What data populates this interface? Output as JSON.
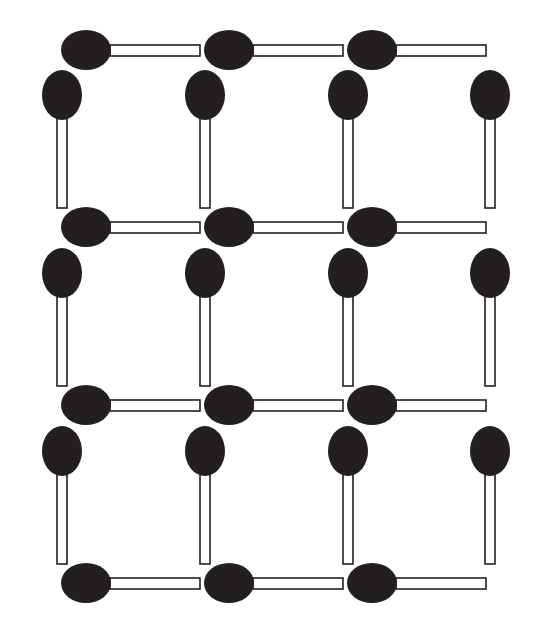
{
  "figure": {
    "width": 542,
    "height": 622,
    "background_color": "#ffffff"
  },
  "style": {
    "head_color": "#231f20",
    "stick_fill": "#ffffff",
    "stick_stroke": "#231f20",
    "stick_stroke_width": 1.6
  },
  "geometry": {
    "column_centers": [
      62,
      205,
      348,
      490
    ],
    "row_centers_horizontal": [
      50,
      227,
      405,
      583
    ],
    "row_tops_vertical": [
      72,
      250,
      428
    ],
    "cell_pitch_x": 143,
    "cell_pitch_y": 178,
    "horizontal_head_rx": 25,
    "horizontal_head_ry": 20,
    "horizontal_stick_length": 90,
    "horizontal_stick_thickness": 11,
    "vertical_head_rx": 20,
    "vertical_head_ry": 25,
    "vertical_stick_length": 90,
    "vertical_stick_thickness": 10
  },
  "counts": {
    "horizontal_matches": 12,
    "vertical_matches": 12,
    "total_matches": 24,
    "unit_squares": 9
  },
  "matches": {
    "horizontal": [
      {
        "id": "h-r0-c0",
        "row": 0,
        "col": 0,
        "head_cx": 86,
        "head_cy": 50,
        "stick_x": 110,
        "stick_y": 45,
        "orientation": "horizontal"
      },
      {
        "id": "h-r0-c1",
        "row": 0,
        "col": 1,
        "head_cx": 229,
        "head_cy": 50,
        "stick_x": 253,
        "stick_y": 45,
        "orientation": "horizontal"
      },
      {
        "id": "h-r0-c2",
        "row": 0,
        "col": 2,
        "head_cx": 372,
        "head_cy": 50,
        "stick_x": 396,
        "stick_y": 45,
        "orientation": "horizontal"
      },
      {
        "id": "h-r1-c0",
        "row": 1,
        "col": 0,
        "head_cx": 86,
        "head_cy": 227,
        "stick_x": 110,
        "stick_y": 222,
        "orientation": "horizontal"
      },
      {
        "id": "h-r1-c1",
        "row": 1,
        "col": 1,
        "head_cx": 229,
        "head_cy": 227,
        "stick_x": 253,
        "stick_y": 222,
        "orientation": "horizontal"
      },
      {
        "id": "h-r1-c2",
        "row": 1,
        "col": 2,
        "head_cx": 372,
        "head_cy": 227,
        "stick_x": 396,
        "stick_y": 222,
        "orientation": "horizontal"
      },
      {
        "id": "h-r2-c0",
        "row": 2,
        "col": 0,
        "head_cx": 86,
        "head_cy": 405,
        "stick_x": 110,
        "stick_y": 400,
        "orientation": "horizontal"
      },
      {
        "id": "h-r2-c1",
        "row": 2,
        "col": 1,
        "head_cx": 229,
        "head_cy": 405,
        "stick_x": 253,
        "stick_y": 400,
        "orientation": "horizontal"
      },
      {
        "id": "h-r2-c2",
        "row": 2,
        "col": 2,
        "head_cx": 372,
        "head_cy": 405,
        "stick_x": 396,
        "stick_y": 400,
        "orientation": "horizontal"
      },
      {
        "id": "h-r3-c0",
        "row": 3,
        "col": 0,
        "head_cx": 86,
        "head_cy": 583,
        "stick_x": 110,
        "stick_y": 578,
        "orientation": "horizontal"
      },
      {
        "id": "h-r3-c1",
        "row": 3,
        "col": 1,
        "head_cx": 229,
        "head_cy": 583,
        "stick_x": 253,
        "stick_y": 578,
        "orientation": "horizontal"
      },
      {
        "id": "h-r3-c2",
        "row": 3,
        "col": 2,
        "head_cx": 372,
        "head_cy": 583,
        "stick_x": 396,
        "stick_y": 578,
        "orientation": "horizontal"
      }
    ],
    "vertical": [
      {
        "id": "v-r0-c0",
        "row": 0,
        "col": 0,
        "head_cx": 62,
        "head_cy": 95,
        "stick_x": 57,
        "stick_y": 118,
        "orientation": "vertical"
      },
      {
        "id": "v-r0-c1",
        "row": 0,
        "col": 1,
        "head_cx": 205,
        "head_cy": 95,
        "stick_x": 200,
        "stick_y": 118,
        "orientation": "vertical"
      },
      {
        "id": "v-r0-c2",
        "row": 0,
        "col": 2,
        "head_cx": 348,
        "head_cy": 95,
        "stick_x": 343,
        "stick_y": 118,
        "orientation": "vertical"
      },
      {
        "id": "v-r0-c3",
        "row": 0,
        "col": 3,
        "head_cx": 490,
        "head_cy": 95,
        "stick_x": 485,
        "stick_y": 118,
        "orientation": "vertical"
      },
      {
        "id": "v-r1-c0",
        "row": 1,
        "col": 0,
        "head_cx": 62,
        "head_cy": 273,
        "stick_x": 57,
        "stick_y": 296,
        "orientation": "vertical"
      },
      {
        "id": "v-r1-c1",
        "row": 1,
        "col": 1,
        "head_cx": 205,
        "head_cy": 273,
        "stick_x": 200,
        "stick_y": 296,
        "orientation": "vertical"
      },
      {
        "id": "v-r1-c2",
        "row": 1,
        "col": 2,
        "head_cx": 348,
        "head_cy": 273,
        "stick_x": 343,
        "stick_y": 296,
        "orientation": "vertical"
      },
      {
        "id": "v-r1-c3",
        "row": 1,
        "col": 3,
        "head_cx": 490,
        "head_cy": 273,
        "stick_x": 485,
        "stick_y": 296,
        "orientation": "vertical"
      },
      {
        "id": "v-r2-c0",
        "row": 2,
        "col": 0,
        "head_cx": 62,
        "head_cy": 451,
        "stick_x": 57,
        "stick_y": 474,
        "orientation": "vertical"
      },
      {
        "id": "v-r2-c1",
        "row": 2,
        "col": 1,
        "head_cx": 205,
        "head_cy": 451,
        "stick_x": 200,
        "stick_y": 474,
        "orientation": "vertical"
      },
      {
        "id": "v-r2-c2",
        "row": 2,
        "col": 2,
        "head_cx": 348,
        "head_cy": 451,
        "stick_x": 343,
        "stick_y": 474,
        "orientation": "vertical"
      },
      {
        "id": "v-r2-c3",
        "row": 2,
        "col": 3,
        "head_cx": 490,
        "head_cy": 451,
        "stick_x": 485,
        "stick_y": 474,
        "orientation": "vertical"
      }
    ]
  }
}
